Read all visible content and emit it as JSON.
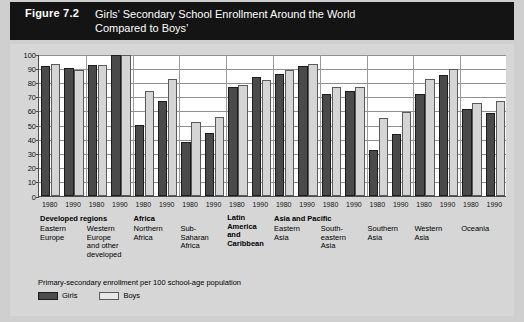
{
  "header": {
    "figure_number": "Figure 7.2",
    "title_line1": "Girls’ Secondary School Enrollment Around the World",
    "title_line2": "Compared to Boys’"
  },
  "legend": {
    "caption": "Primary-secondary enrollment per 100 school-age population",
    "girls_label": "Girls",
    "boys_label": "Boys",
    "girls_color": "#4a4a4a",
    "boys_color": "#d5d5d5"
  },
  "group_headers": [
    {
      "label": "Developed regions",
      "at_group": 0
    },
    {
      "label": "Africa",
      "at_group": 2
    },
    {
      "label": "Asia and Pacific",
      "at_group": 5
    }
  ],
  "chart_data": {
    "type": "bar",
    "title": "Girls’ Secondary School Enrollment Around the World Compared to Boys’",
    "subtitle": "Primary-secondary enrollment per 100 school-age population",
    "xlabel": "",
    "ylabel": "",
    "ylim": [
      0,
      100
    ],
    "yticks": [
      0,
      10,
      20,
      30,
      40,
      50,
      60,
      70,
      80,
      90,
      100
    ],
    "grid": true,
    "legend_position": "bottom-left",
    "years": [
      "1980",
      "1990"
    ],
    "categories": [
      "Eastern Europe",
      "Western Europe and other developed",
      "Northern Africa",
      "Sub-Saharan Africa",
      "Latin America and Caribbean",
      "Eastern Asia",
      "South-eastern Asia",
      "Southern Asia",
      "Western Asia",
      "Oceania"
    ],
    "series": [
      {
        "name": "Girls",
        "color": "#4a4a4a",
        "values_1980": [
          91.5,
          92.0,
          50.0,
          38.0,
          76.5,
          86.0,
          72.0,
          32.5,
          71.5,
          61.5
        ],
        "values_1990": [
          90.5,
          99.5,
          67.0,
          44.5,
          84.0,
          91.5,
          74.0,
          43.5,
          85.0,
          58.5
        ]
      },
      {
        "name": "Boys",
        "color": "#d5d5d5",
        "values_1980": [
          93.0,
          92.5,
          74.0,
          52.0,
          78.0,
          89.0,
          77.0,
          55.0,
          82.5,
          65.5
        ],
        "values_1990": [
          89.0,
          99.0,
          82.5,
          55.5,
          81.5,
          93.0,
          77.0,
          59.0,
          89.5,
          67.0
        ]
      }
    ]
  },
  "region_label_lines": [
    [
      "Eastern",
      "Europe"
    ],
    [
      "Western",
      "Europe",
      "and other",
      "developed"
    ],
    [
      "Northern",
      "Africa"
    ],
    [
      "Sub-",
      "Saharan",
      "Africa"
    ],
    [
      "Latin",
      "America",
      "and",
      "Caribbean"
    ],
    [
      "Eastern",
      "Asia"
    ],
    [
      "South-",
      "eastern",
      "Asia"
    ],
    [
      "Southern",
      "Asia"
    ],
    [
      "Western",
      "Asia"
    ],
    [
      "Oceania"
    ]
  ]
}
